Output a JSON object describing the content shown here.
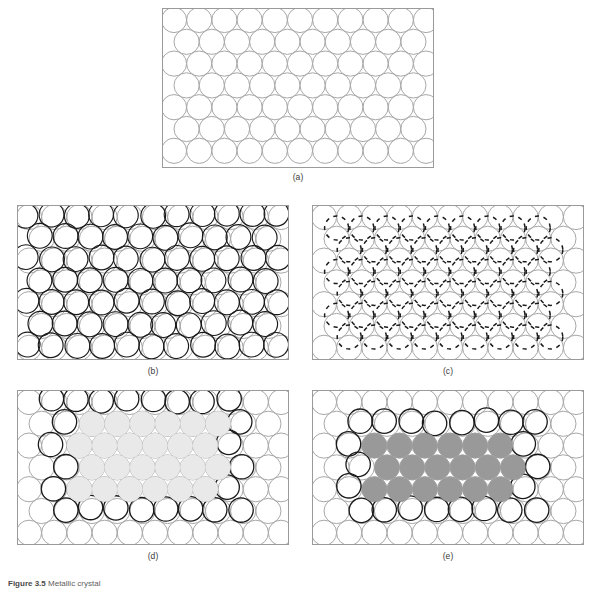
{
  "figure": {
    "caption_number": "Figure 3.5",
    "caption_text": "Metallic crystal",
    "background_color": "#ffffff"
  },
  "style": {
    "box_stroke": "#9a9a9a",
    "light_circle_stroke": "#a8a8a8",
    "dark_circle_stroke": "#1a1a1a",
    "light_fill": "#e9e9e9",
    "dark_fill": "#999999",
    "circle_radius": 12.6,
    "row_spacing": 21.8,
    "col_spacing": 25.2
  },
  "panels": [
    {
      "id": "a",
      "label": "(a)",
      "width": 272,
      "height": 160,
      "description": "perfect close-packed array of undistorted atoms",
      "layers": [
        {
          "name": "base-lattice",
          "kind": "light-outline",
          "offset_x": 0,
          "offset_y": 0,
          "rows": 7,
          "cols": 11
        }
      ]
    },
    {
      "id": "b",
      "label": "(b)",
      "width": 272,
      "height": 155,
      "description": "two lattices slightly translated showing small-angle mismatch",
      "layers": [
        {
          "name": "base-lattice",
          "kind": "light-outline",
          "offset_x": 0,
          "offset_y": 0,
          "rows": 7,
          "cols": 11
        },
        {
          "name": "shifted-lattice",
          "kind": "dark-outline",
          "offset_x": -2.2,
          "offset_y": -2.2,
          "rows": 7,
          "cols": 11
        }
      ]
    },
    {
      "id": "c",
      "label": "(c)",
      "width": 272,
      "height": 155,
      "description": "interstitial dashed lattice rotated relative to base lattice",
      "layers": [
        {
          "name": "base-lattice",
          "kind": "light-outline",
          "offset_x": 0,
          "offset_y": 0,
          "rows": 7,
          "cols": 11
        },
        {
          "name": "interstitial-lattice",
          "kind": "dark-dashed",
          "offset_x": 12.6,
          "offset_y": 11.0,
          "rows": 6,
          "cols": 9
        }
      ]
    },
    {
      "id": "d",
      "label": "(d)",
      "width": 272,
      "height": 155,
      "description": "light-shaded grain nucleus bounded by dark grain-boundary atoms",
      "layers": [
        {
          "name": "base-lattice",
          "kind": "light-outline",
          "offset_x": 0,
          "offset_y": 0,
          "rows": 7,
          "cols": 11
        },
        {
          "name": "boundary-ring",
          "kind": "dark-outline-ring",
          "offset_x": -2.0,
          "offset_y": -2.0
        },
        {
          "name": "grain-nucleus",
          "kind": "light-filled",
          "rows": 4,
          "cols": 6
        }
      ]
    },
    {
      "id": "e",
      "label": "(e)",
      "width": 272,
      "height": 155,
      "description": "dark-shaded grain core surrounded by dark boundary atoms",
      "layers": [
        {
          "name": "base-lattice",
          "kind": "light-outline",
          "offset_x": 0,
          "offset_y": 0,
          "rows": 7,
          "cols": 11
        },
        {
          "name": "boundary-ring",
          "kind": "dark-outline-ring",
          "offset_x": -2.0,
          "offset_y": -2.0
        },
        {
          "name": "grain-core",
          "kind": "dark-filled",
          "rows": 3,
          "cols": 6
        }
      ]
    }
  ]
}
